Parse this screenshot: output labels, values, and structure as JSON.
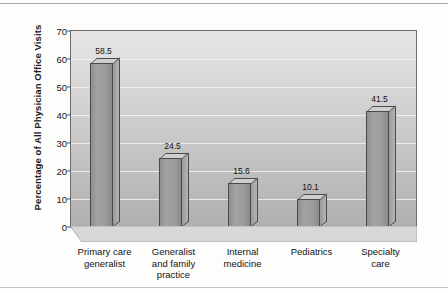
{
  "figure": {
    "background_color": "#fdfdfc",
    "plot_background_top": "#e6e6e6",
    "plot_background_bottom": "#b0b0b0",
    "bar_face_color": "#9c9c9c",
    "bar_outline_color": "#4a4a4a",
    "gridline_color": "#f2f2f2",
    "axis_color": "#6d6d6d"
  },
  "chart_data": {
    "type": "bar",
    "title": "",
    "xlabel": "",
    "ylabel": "Percentage of All Physician Office Visits",
    "categories": [
      "Primary care generalist",
      "Generalist and family practice",
      "Internal medicine",
      "Pediatrics",
      "Specialty care"
    ],
    "category_lines": [
      [
        "Primary care",
        "generalist"
      ],
      [
        "Generalist",
        "and family",
        "practice"
      ],
      [
        "Internal",
        "medicine"
      ],
      [
        "Pediatrics"
      ],
      [
        "Specialty",
        "care"
      ]
    ],
    "values": [
      58.5,
      24.5,
      15.6,
      10.1,
      41.5
    ],
    "value_labels": [
      "58.5",
      "24.5",
      "15.6",
      "10.1",
      "41.5"
    ],
    "ylim": [
      0,
      70
    ],
    "yticks": [
      0,
      10,
      20,
      30,
      40,
      50,
      60,
      70
    ],
    "ytick_labels": [
      "0",
      "10",
      "20",
      "30",
      "40",
      "50",
      "60",
      "70"
    ],
    "grid": true,
    "grid_axis": "y",
    "legend": null,
    "legend_position": "none",
    "style": "3d-bars-grayscale"
  }
}
